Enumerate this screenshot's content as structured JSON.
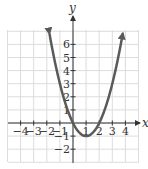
{
  "chart_data": {
    "type": "line",
    "title": "",
    "xlabel": "x",
    "ylabel": "y",
    "function": "y = x^2 - 2x",
    "xlim": [
      -5,
      5
    ],
    "ylim": [
      -3,
      7
    ],
    "grid": true,
    "x_ticks": [
      -4,
      -3,
      -2,
      -1,
      1,
      2,
      3,
      4
    ],
    "x_tick_labels": [
      "−4",
      "−3",
      "−2",
      "−1",
      "1",
      "2",
      "3",
      "4"
    ],
    "y_ticks": [
      -2,
      -1,
      1,
      2,
      3,
      4,
      5,
      6
    ],
    "y_tick_labels": [
      "−2",
      "−1",
      "1",
      "2",
      "3",
      "4",
      "5",
      "6"
    ],
    "series": [
      {
        "name": "parabola",
        "x": [
          -1.8,
          -1.5,
          -1,
          -0.5,
          0,
          0.5,
          1,
          1.5,
          2,
          2.5,
          3,
          3.5,
          3.8
        ],
        "y": [
          6.84,
          5.25,
          3,
          1.25,
          0,
          -0.75,
          -1,
          -0.75,
          0,
          1.25,
          3,
          5.25,
          6.84
        ]
      }
    ],
    "vertex": [
      1,
      -1
    ],
    "x_intercepts": [
      0,
      2
    ],
    "colors": {
      "curve": "#5a5a5a",
      "axis": "#333333",
      "grid": "#dcdcdc"
    }
  }
}
